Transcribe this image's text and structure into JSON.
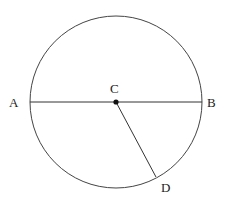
{
  "diagram": {
    "type": "geometry-circle",
    "circle": {
      "cx": 116,
      "cy": 102,
      "r": 86
    },
    "points": {
      "A": {
        "label": "A",
        "x": 30,
        "y": 102
      },
      "B": {
        "label": "B",
        "x": 202,
        "y": 102
      },
      "C": {
        "label": "C",
        "x": 116,
        "y": 102
      },
      "D": {
        "label": "D",
        "x": 156,
        "y": 177
      }
    },
    "segments": [
      {
        "name": "diameter-AB",
        "from": "A",
        "to": "B"
      },
      {
        "name": "radius-CD",
        "from": "C",
        "to": "D"
      }
    ],
    "stroke_color": "#333333"
  }
}
